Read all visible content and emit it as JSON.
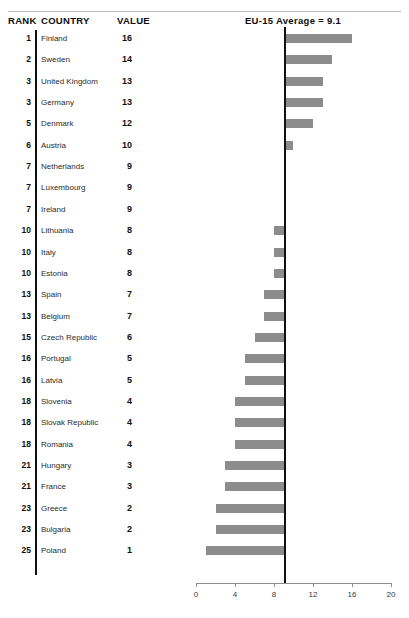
{
  "header": {
    "rank_label": "RANK",
    "country_label": "COUNTRY",
    "value_label": "VALUE",
    "chart_title": "EU-15 Average = 9.1"
  },
  "style": {
    "bar_color": "#8c8c8c",
    "avg_line_color": "#121212",
    "axis_color": "#8d8d8d",
    "rule_color": "#b9b9b9"
  },
  "chart_data": {
    "type": "bar",
    "orientation": "horizontal",
    "title": "EU-15 Average = 9.1",
    "xlabel": "",
    "ylabel": "",
    "xlim": [
      0,
      20
    ],
    "xticks": [
      0,
      4,
      8,
      12,
      16,
      20
    ],
    "xtick_labels": [
      "0",
      "4",
      "8",
      "12",
      "16",
      "20"
    ],
    "grid": false,
    "legend": null,
    "reference_line": {
      "label": "EU-15 Average",
      "value": 9.1
    },
    "columns": [
      "RANK",
      "COUNTRY",
      "VALUE"
    ],
    "categories": [
      "Finland",
      "Sweden",
      "United Kingdom",
      "Germany",
      "Denmark",
      "Austria",
      "Netherlands",
      "Luxembourg",
      "Ireland",
      "Lithuania",
      "Italy",
      "Estonia",
      "Spain",
      "Belgium",
      "Czech Republic",
      "Portugal",
      "Latvia",
      "Slovenia",
      "Slovak Republic",
      "Romania",
      "Hungary",
      "France",
      "Greece",
      "Bulgaria",
      "Poland"
    ],
    "values": [
      16,
      14,
      13,
      13,
      12,
      10,
      9,
      9,
      9,
      8,
      8,
      8,
      7,
      7,
      6,
      5,
      5,
      4,
      4,
      4,
      3,
      3,
      2,
      2,
      1
    ],
    "ranks": [
      1,
      2,
      3,
      3,
      5,
      6,
      7,
      7,
      7,
      10,
      10,
      10,
      13,
      13,
      15,
      16,
      16,
      18,
      18,
      18,
      21,
      21,
      23,
      23,
      25
    ]
  },
  "rows": [
    {
      "rank": "1",
      "country": "Finland",
      "value": "16"
    },
    {
      "rank": "2",
      "country": "Sweden",
      "value": "14"
    },
    {
      "rank": "3",
      "country": "United Kingdom",
      "value": "13"
    },
    {
      "rank": "3",
      "country": "Germany",
      "value": "13"
    },
    {
      "rank": "5",
      "country": "Denmark",
      "value": "12"
    },
    {
      "rank": "6",
      "country": "Austria",
      "value": "10"
    },
    {
      "rank": "7",
      "country": "Netherlands",
      "value": "9"
    },
    {
      "rank": "7",
      "country": "Luxembourg",
      "value": "9"
    },
    {
      "rank": "7",
      "country": "Ireland",
      "value": "9"
    },
    {
      "rank": "10",
      "country": "Lithuania",
      "value": "8"
    },
    {
      "rank": "10",
      "country": "Italy",
      "value": "8"
    },
    {
      "rank": "10",
      "country": "Estonia",
      "value": "8"
    },
    {
      "rank": "13",
      "country": "Spain",
      "value": "7"
    },
    {
      "rank": "13",
      "country": "Belgium",
      "value": "7"
    },
    {
      "rank": "15",
      "country": "Czech Republic",
      "value": "6"
    },
    {
      "rank": "16",
      "country": "Portugal",
      "value": "5"
    },
    {
      "rank": "16",
      "country": "Latvia",
      "value": "5"
    },
    {
      "rank": "18",
      "country": "Slovenia",
      "value": "4"
    },
    {
      "rank": "18",
      "country": "Slovak Republic",
      "value": "4"
    },
    {
      "rank": "18",
      "country": "Romania",
      "value": "4"
    },
    {
      "rank": "21",
      "country": "Hungary",
      "value": "3"
    },
    {
      "rank": "21",
      "country": "France",
      "value": "3"
    },
    {
      "rank": "23",
      "country": "Greece",
      "value": "2"
    },
    {
      "rank": "23",
      "country": "Bulgaria",
      "value": "2"
    },
    {
      "rank": "25",
      "country": "Poland",
      "value": "1"
    }
  ]
}
